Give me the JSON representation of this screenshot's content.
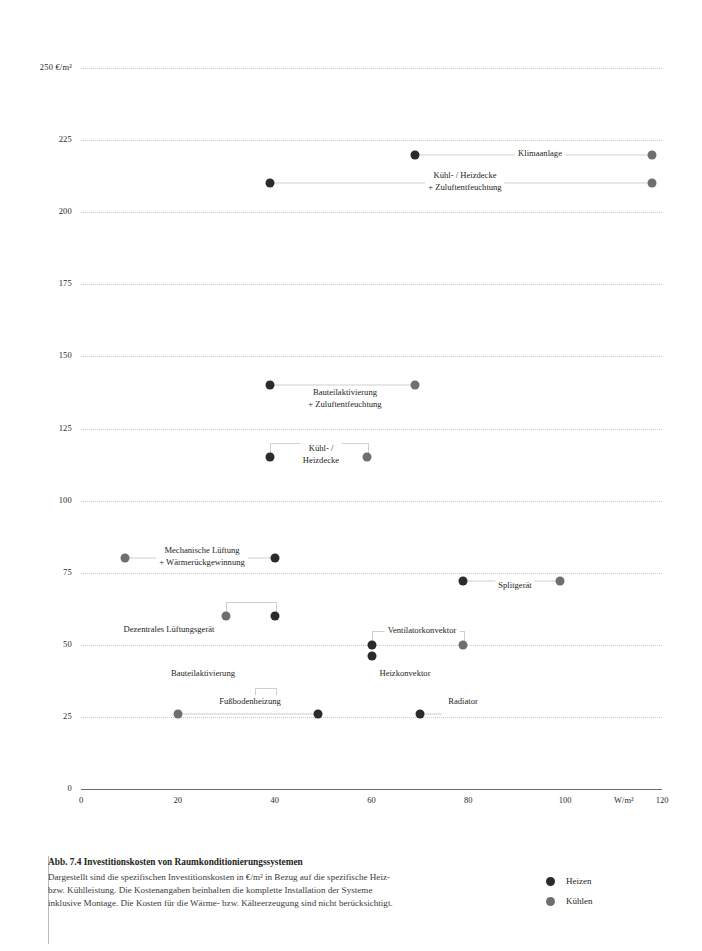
{
  "chart_data": {
    "type": "scatter",
    "title": "Abb. 7.4 Investitionskosten von Raumkonditionierungssystemen",
    "xlabel": "W/m²",
    "ylabel": "€/m²",
    "xlim": [
      0,
      120
    ],
    "ylim": [
      0,
      250
    ],
    "grid": true,
    "yticks": [
      0,
      25,
      50,
      75,
      100,
      125,
      150,
      175,
      200,
      225,
      250
    ],
    "ytick_labels": [
      "0",
      "25",
      "50",
      "75",
      "100",
      "125",
      "150",
      "175",
      "200",
      "225",
      "250 €/m²"
    ],
    "xticks": [
      0,
      20,
      40,
      60,
      80,
      100,
      120
    ],
    "xtick_labels": [
      "0",
      "20",
      "40",
      "60",
      "80",
      "100",
      "120"
    ],
    "x_unit_label": "W/m²",
    "legend": [
      {
        "name": "Heizen",
        "color": "#2b2b2b"
      },
      {
        "name": "Kühlen",
        "color": "#6f6f6f"
      }
    ],
    "legend_position": "bottom-right",
    "systems": [
      {
        "label": "Klimaanlage",
        "label_lines": [
          "Klimaanlage"
        ],
        "cost": 220,
        "heizen_x": 69,
        "kuehlen_x": 118,
        "label_x": 540,
        "label_y": 147,
        "connector": true
      },
      {
        "label": "Kühl- / Heizdecke + Zuluftentfeuchtung",
        "label_lines": [
          "Kühl- / Heizdecke",
          "+ Zuluftentfeuchtung"
        ],
        "cost": 210,
        "heizen_x": 39,
        "kuehlen_x": 118,
        "label_x": 465,
        "label_y": 169,
        "connector": true
      },
      {
        "label": "Bauteilaktivierung + Zuluftentfeuchtung",
        "label_lines": [
          "Bauteilaktivierung",
          "+ Zuluftentfeuchtung"
        ],
        "cost": 140,
        "heizen_x": 39,
        "kuehlen_x": 69,
        "label_x": 345,
        "label_y": 386,
        "connector": true
      },
      {
        "label": "Kühl- / Heizdecke",
        "label_lines": [
          "Kühl- /",
          "Heizdecke"
        ],
        "cost": 115,
        "heizen_x": 39,
        "kuehlen_x": 59,
        "label_x": 321,
        "label_y": 442,
        "connector": false
      },
      {
        "label": "Mechanische Lüftung + Wärmerückgewinnung",
        "label_lines": [
          "Mechanische Lüftung",
          "+ Wärmerückgewinnung"
        ],
        "cost": 80,
        "heizen_x": 40,
        "kuehlen_x": 9,
        "label_x": 202,
        "label_y": 544,
        "connector": true
      },
      {
        "label": "Splitgerät",
        "label_lines": [
          "Splitgerät"
        ],
        "cost": 72,
        "heizen_x": 79,
        "kuehlen_x": 99,
        "label_x": 515,
        "label_y": 579,
        "connector": true
      },
      {
        "label": "Dezentrales Lüftungsgerät",
        "label_lines": [
          "Dezentrales Lüftungsgerät"
        ],
        "cost": 60,
        "heizen_x": 40,
        "kuehlen_x": 30,
        "label_x": 169,
        "label_y": 623,
        "connector": false
      },
      {
        "label": "Ventilatorkonvektor",
        "label_lines": [
          "Ventilatorkonvektor"
        ],
        "cost": 50,
        "heizen_x": 60,
        "kuehlen_x": 79,
        "label_x": 422,
        "label_y": 624,
        "connector": false
      },
      {
        "label": "Heizkonvektor",
        "label_lines": [
          "Heizkonvektor"
        ],
        "cost": 46,
        "heizen_x": 60,
        "kuehlen_x": null,
        "label_x": 405,
        "label_y": 667,
        "connector": false
      },
      {
        "label": "Bauteilaktivierung",
        "label_lines": [
          "Bauteilaktivierung"
        ],
        "cost": 30,
        "heizen_x": 40,
        "kuehlen_x": 36,
        "label_x": 203,
        "label_y": 667,
        "connector": false
      },
      {
        "label": "Fußbodenheizung",
        "label_lines": [
          "Fußbodenheizung"
        ],
        "cost": 26,
        "heizen_x": 49,
        "kuehlen_x": 20,
        "label_x": 250,
        "label_y": 695,
        "connector": true
      },
      {
        "label": "Radiator",
        "label_lines": [
          "Radiator"
        ],
        "cost": 26,
        "heizen_x": 70,
        "kuehlen_x": null,
        "label_x": 463,
        "label_y": 695,
        "connector": true
      }
    ]
  },
  "caption": {
    "title": "Abb. 7.4 Investitionskosten von Raumkonditionierungssystemen",
    "body": "Dargestellt sind die spezifischen Investitionskosten in €/m² in Bezug auf die spezifische Heiz- bzw. Kühlleistung. Die Kostenangaben beinhalten die komplette Installation der Systeme inklusive Montage. Die Kosten für die Wärme- bzw. Kälteerzeugung sind nicht berücksichtigt."
  },
  "colors": {
    "heizen": "#2b2b2b",
    "kuehlen": "#6f6f6f",
    "grid": "#c8c8c8",
    "axis": "#6b6b6b"
  }
}
